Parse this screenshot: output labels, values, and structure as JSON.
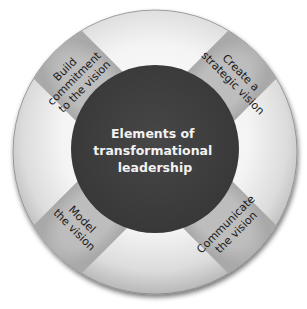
{
  "diagram": {
    "title": "Elements of transformational leadership",
    "center": {
      "lines": [
        "Elements of",
        "transformational",
        "leadership"
      ]
    },
    "elements": [
      {
        "position": "top-left",
        "lines": [
          "Build",
          "commitment",
          "to the vision"
        ]
      },
      {
        "position": "top-right",
        "lines": [
          "Create a",
          "strategic vision"
        ]
      },
      {
        "position": "bottom-right",
        "lines": [
          "Communicate",
          "the vision"
        ]
      },
      {
        "position": "bottom-left",
        "lines": [
          "Model",
          "the vision"
        ]
      }
    ],
    "colors": {
      "center_fill": "#3f3f3f",
      "center_text": "#f2f2f2",
      "band_fill": "#b4b4b4",
      "ring_light": "#ececec",
      "ring_shadow": "#555555",
      "band_text": "#1a1a1a"
    }
  }
}
